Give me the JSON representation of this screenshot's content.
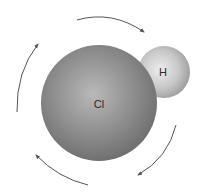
{
  "diagram": {
    "atoms": [
      {
        "symbol": "Cl",
        "label": "Cl",
        "color": "#8a8a8a"
      },
      {
        "symbol": "H",
        "label": "H",
        "color": "#c4c4c4"
      }
    ],
    "arrows": {
      "count": 4,
      "direction": "clockwise",
      "color": "#555555"
    }
  }
}
